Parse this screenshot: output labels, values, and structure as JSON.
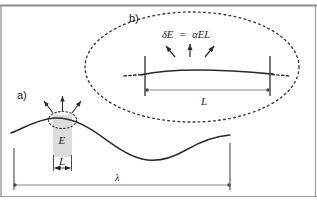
{
  "figure": {
    "panel_a": {
      "label": "a)",
      "field_label": "E",
      "width_label": "L",
      "wavelength_label": "λ",
      "arrow_count": 3
    },
    "panel_b": {
      "label": "b)",
      "formula": "δE = αEL",
      "formula_parts": {
        "delta_e": "δE",
        "equals": "=",
        "alpha_e_l": "αEL"
      },
      "width_label": "L",
      "arrow_count": 3
    },
    "colors": {
      "stroke": "#1a1a1a",
      "curve": "#2b2b2b",
      "shade_fill": "#dcdcdc",
      "dotted": "#3a3a3a",
      "measure_line": "#7a7a7a",
      "frame": "#8c8c8c",
      "background": "#ffffff"
    }
  }
}
